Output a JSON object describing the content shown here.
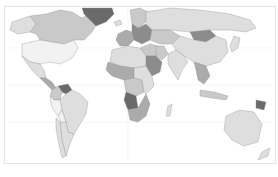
{
  "map": {
    "type": "choropleth",
    "projection": "world",
    "colors": {
      "ocean": "#ffffff",
      "border": "#8a8a8a",
      "frame": "#e4e4e4",
      "shade_levels": [
        "#f2f2f2",
        "#dedede",
        "#c9c9c9",
        "#ababab",
        "#8c8c8c",
        "#6a6a6a"
      ]
    },
    "regions": [
      {
        "name": "Canada",
        "level": 2
      },
      {
        "name": "Alaska",
        "level": 1
      },
      {
        "name": "Greenland",
        "level": 5
      },
      {
        "name": "United States",
        "level": 0
      },
      {
        "name": "Mexico",
        "level": 1
      },
      {
        "name": "Central America",
        "level": 3
      },
      {
        "name": "Venezuela",
        "level": 5
      },
      {
        "name": "Colombia",
        "level": 2
      },
      {
        "name": "Brazil",
        "level": 1
      },
      {
        "name": "Peru",
        "level": 0
      },
      {
        "name": "Bolivia",
        "level": 0
      },
      {
        "name": "Argentina",
        "level": 1
      },
      {
        "name": "Chile",
        "level": 1
      },
      {
        "name": "Iceland",
        "level": 1
      },
      {
        "name": "Scandinavia",
        "level": 2
      },
      {
        "name": "Western Europe",
        "level": 3
      },
      {
        "name": "Eastern Europe",
        "level": 4
      },
      {
        "name": "Russia",
        "level": 1
      },
      {
        "name": "Kazakhstan",
        "level": 2
      },
      {
        "name": "Mongolia",
        "level": 4
      },
      {
        "name": "China",
        "level": 1
      },
      {
        "name": "India",
        "level": 1
      },
      {
        "name": "Middle East",
        "level": 2
      },
      {
        "name": "Saudi Arabia",
        "level": 4
      },
      {
        "name": "Iran",
        "level": 2
      },
      {
        "name": "North Africa",
        "level": 1
      },
      {
        "name": "West Africa",
        "level": 3
      },
      {
        "name": "Central Africa",
        "level": 2
      },
      {
        "name": "East Africa",
        "level": 1
      },
      {
        "name": "Angola",
        "level": 5
      },
      {
        "name": "Southern Africa",
        "level": 3
      },
      {
        "name": "Madagascar",
        "level": 1
      },
      {
        "name": "Southeast Asia",
        "level": 3
      },
      {
        "name": "Indonesia",
        "level": 2
      },
      {
        "name": "Papua New Guinea",
        "level": 5
      },
      {
        "name": "Japan",
        "level": 1
      },
      {
        "name": "Australia",
        "level": 1
      },
      {
        "name": "New Zealand",
        "level": 1
      }
    ]
  }
}
